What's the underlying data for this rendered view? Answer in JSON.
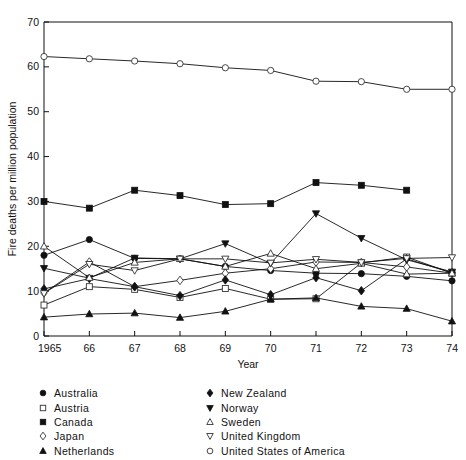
{
  "chart_data": {
    "type": "line",
    "title": "",
    "xlabel": "Year",
    "ylabel": "Fire deaths per million population",
    "x": [
      1965,
      1966,
      1967,
      1968,
      1969,
      1970,
      1971,
      1972,
      1973,
      1974
    ],
    "xtick_labels": [
      "1965",
      "66",
      "67",
      "68",
      "69",
      "70",
      "71",
      "72",
      "73",
      "74"
    ],
    "ytick_labels": [
      "0",
      "10",
      "20",
      "30",
      "40",
      "50",
      "60",
      "70"
    ],
    "ytick_values": [
      0,
      10,
      20,
      30,
      40,
      50,
      60,
      70
    ],
    "ylim": [
      0,
      70
    ],
    "xlim": [
      1965,
      1974
    ],
    "grid": false,
    "legend_position": "below-plot",
    "series": [
      {
        "name": "Australia",
        "marker": "filled-circle",
        "values": [
          18.0,
          21.5,
          17.3,
          17.2,
          15.5,
          14.6,
          14.0,
          13.9,
          13.3,
          12.3
        ]
      },
      {
        "name": "Austria",
        "marker": "open-square",
        "values": [
          6.9,
          11.0,
          10.4,
          8.6,
          10.6,
          8.2,
          8.3,
          16.3,
          17.6,
          14.0
        ]
      },
      {
        "name": "Canada",
        "marker": "filled-square",
        "values": [
          30.0,
          28.5,
          32.5,
          31.3,
          29.3,
          29.5,
          34.2,
          33.6,
          32.5,
          null
        ]
      },
      {
        "name": "Japan",
        "marker": "open-diamond",
        "values": [
          9.6,
          16.5,
          11.0,
          12.4,
          14.0,
          15.0,
          16.5,
          16.4,
          15.4,
          14.0
        ]
      },
      {
        "name": "Netherlands",
        "marker": "filled-triangle-up",
        "values": [
          4.2,
          4.9,
          5.1,
          4.1,
          5.5,
          8.2,
          8.5,
          6.6,
          6.1,
          3.3
        ]
      },
      {
        "name": "New Zealand",
        "marker": "filled-diamond",
        "values": [
          10.5,
          12.8,
          11.0,
          9.0,
          12.5,
          9.2,
          13.0,
          10.1,
          17.2,
          14.1
        ]
      },
      {
        "name": "Norway",
        "marker": "filled-triangle-down",
        "values": [
          15.1,
          12.9,
          17.4,
          17.2,
          20.6,
          16.2,
          27.3,
          21.8,
          17.0,
          14.3
        ]
      },
      {
        "name": "Sweden",
        "marker": "open-triangle-up",
        "values": [
          20.0,
          13.0,
          16.4,
          17.2,
          15.5,
          18.4,
          15.0,
          16.2,
          13.8,
          14.0
        ]
      },
      {
        "name": "United Kingdom",
        "marker": "open-triangle-down",
        "values": [
          9.5,
          16.0,
          14.6,
          17.2,
          17.2,
          16.3,
          17.1,
          16.4,
          17.3,
          17.5
        ]
      },
      {
        "name": "United States of America",
        "marker": "open-circle",
        "values": [
          62.3,
          61.8,
          61.3,
          60.7,
          59.8,
          59.2,
          56.8,
          56.7,
          55.0,
          55.0
        ]
      }
    ]
  },
  "legend": {
    "left_column": [
      {
        "label": "Australia",
        "marker": "filled-circle"
      },
      {
        "label": "Austria",
        "marker": "open-square"
      },
      {
        "label": "Canada",
        "marker": "filled-square"
      },
      {
        "label": "Japan",
        "marker": "open-diamond"
      },
      {
        "label": "Netherlands",
        "marker": "filled-triangle-up"
      }
    ],
    "right_column": [
      {
        "label": "New Zealand",
        "marker": "filled-diamond"
      },
      {
        "label": "Norway",
        "marker": "filled-triangle-down"
      },
      {
        "label": "Sweden",
        "marker": "open-triangle-up"
      },
      {
        "label": "United Kingdom",
        "marker": "open-triangle-down"
      },
      {
        "label": "United States of America",
        "marker": "open-circle"
      }
    ]
  },
  "colors": {
    "ink": "#111111",
    "background": "#ffffff",
    "marker_open_fill": "#ffffff"
  }
}
